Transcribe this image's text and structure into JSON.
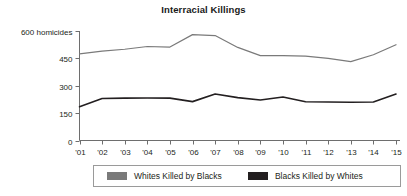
{
  "chart_data": {
    "type": "line",
    "title": "Interracial Killings",
    "xlabel": "",
    "ylabel": "600 homicides",
    "ylim": [
      0,
      600
    ],
    "yticks": [
      0,
      150,
      300,
      450,
      600
    ],
    "ytick_labels": [
      "0",
      "150",
      "300",
      "450",
      "600 homicides"
    ],
    "grid": false,
    "legend_position": "bottom",
    "categories": [
      "'01",
      "'02",
      "'03",
      "'04",
      "'05",
      "'06",
      "'07",
      "'08",
      "'09",
      "'10",
      "'11",
      "'12",
      "'13",
      "'14",
      "'15"
    ],
    "series": [
      {
        "name": "Whites Killed by Blacks",
        "color": "#7a7a7a",
        "values": [
          475,
          490,
          500,
          515,
          512,
          580,
          575,
          510,
          465,
          465,
          462,
          450,
          432,
          470,
          525
        ]
      },
      {
        "name": "Blacks Killed by Whites",
        "color": "#231f20",
        "values": [
          185,
          230,
          232,
          233,
          232,
          213,
          255,
          235,
          222,
          238,
          212,
          211,
          210,
          211,
          255
        ]
      }
    ]
  },
  "axis": {
    "y_tick_600": "600 homicides",
    "y_tick_450": "450",
    "y_tick_300": "300",
    "y_tick_150": "150",
    "y_tick_0": "0"
  },
  "legend": {
    "entries": [
      {
        "label": "Whites Killed by Blacks",
        "color": "#7a7a7a"
      },
      {
        "label": "Blacks Killed by Whites",
        "color": "#231f20"
      }
    ]
  }
}
